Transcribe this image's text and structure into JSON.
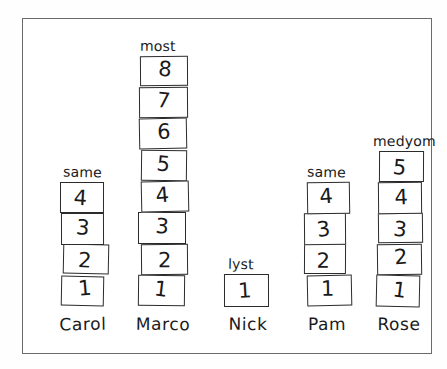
{
  "chart_data": {
    "type": "bar",
    "title": "",
    "subtitle": "",
    "xlabel": "",
    "ylabel": "",
    "categories": [
      "Carol",
      "Marco",
      "Nick",
      "Pam",
      "Rose"
    ],
    "values": [
      4,
      8,
      1,
      4,
      5
    ],
    "ylim": [
      0,
      8
    ],
    "grid": false,
    "legend": "none",
    "annotations": [
      "same",
      "most",
      "lyst",
      "same",
      "medyom"
    ],
    "bar_style": "stacked-numbered-blocks",
    "block_numbering": "bottom-to-top starting at 1",
    "series": [
      {
        "name": "blocks",
        "values": [
          4,
          8,
          1,
          4,
          5
        ]
      }
    ]
  },
  "frame": {
    "border_color": "#6a6a6a"
  },
  "ink": {
    "color": "#1a1a1a",
    "block_border": "#2b2b2b"
  },
  "stacks": [
    {
      "id": "carol",
      "name": "Carol",
      "comparison": "same",
      "count": 4,
      "blocks": [
        "4",
        "3",
        "2",
        "1"
      ]
    },
    {
      "id": "marco",
      "name": "Marco",
      "comparison": "most",
      "count": 8,
      "blocks": [
        "8",
        "7",
        "6",
        "5",
        "4",
        "3",
        "2",
        "1"
      ]
    },
    {
      "id": "nick",
      "name": "Nick",
      "comparison": "lyst",
      "count": 1,
      "blocks": [
        "1"
      ]
    },
    {
      "id": "pam",
      "name": "Pam",
      "comparison": "same",
      "count": 4,
      "blocks": [
        "4",
        "3",
        "2",
        "1"
      ]
    },
    {
      "id": "rose",
      "name": "Rose",
      "comparison": "medyom",
      "count": 5,
      "blocks": [
        "5",
        "4",
        "3",
        "2",
        "1"
      ]
    }
  ]
}
